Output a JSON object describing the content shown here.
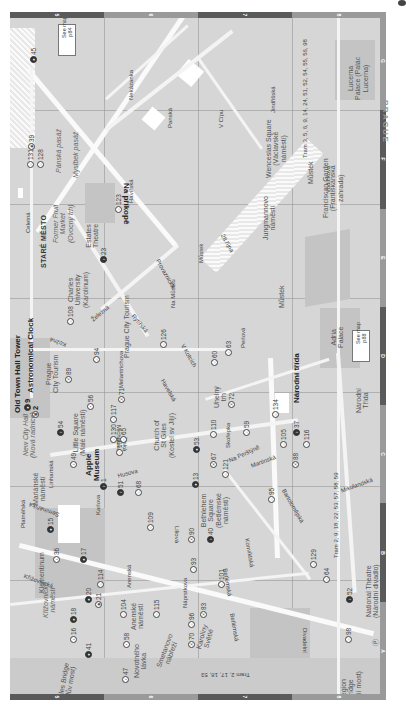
{
  "page": {
    "side_label": "PRAGUE",
    "column_labels": [
      "5",
      "6",
      "7",
      "8"
    ],
    "row_labels": [
      "G",
      "F",
      "E",
      "D",
      "C",
      "B",
      "A"
    ]
  },
  "callouts": [
    {
      "text": "See map\np84"
    },
    {
      "text": "See map\np88"
    }
  ],
  "landmarks": {
    "old_town_hall": "Old Town Hall Tower",
    "astronomical_clock": "Astronomical Clock",
    "stare_mesto": "STARÉ MĚSTO",
    "apple_museum": "Apple\nMuseum",
    "prague_city_tourism_1": "Prague\nCity Tourism",
    "prague_city_tourism_2": "Prague City Tourism",
    "charles_university": "Charles\nUniversity\n(Karolinum)",
    "estates_theatre": "Estates\nTheatre",
    "former_fruit_market": "Former Fruit\nMarket\n(Ovocný trh)",
    "wenceslas_square": "Wenceslas Square\n(Václavské\nnáměstí)",
    "franciscan_garden": "Franciscan Garden\n(Františkánská\nzahrada)",
    "lucerna_palace": "Lucerna\nPalace (Palác\nLucerna)",
    "adria_palace": "Adria\nPalace",
    "little_square": "Little Square\n(Malé náměstí)",
    "new_city_hall": "New City Hall\n(Nová radnice)",
    "church_st_giles": "Church of\nSt Giles\n(Kostel sv Jiljí)",
    "bethlehem_square": "Bethlehem\nSquare\n(Betlémské\nnáměstí)",
    "mariánské": "Mariánské\nnáměstí",
    "klementinum": "Klementinum",
    "krizovnicke": "Křižovnické\nnáměstí",
    "charles_bridge": "Charles Bridge\n(Karlův most)",
    "legion_bridge": "Legion\nBridge\n(Legií most)",
    "national_theatre": "National Theatre\n(Národní divadlo)",
    "jungmannovo": "Jungmannovo\nnáměstí",
    "uhelny_trh": "Uhelný\ntrh",
    "arenske": "Anenské\nnáměstí",
    "novotneho": "Novotného\nlávka",
    "karoliny": "Karoliny\nSvětlé",
    "narodni_trida_metro": "Národní\nTřída"
  },
  "streets": {
    "na_prikope": "Na příkopě",
    "celetna": "Celetná",
    "panska_pasaz": "Pánská pasáž",
    "myslbek_pasaz": "Myslbek pasáž",
    "havirska": "Havířská",
    "provaznicka": "Provaznická",
    "na_mustku": "Na Můstku",
    "28_rijna": "28.října",
    "zelezna": "Železná",
    "rytirska": "Rytířská",
    "kozna": "Kožná",
    "melantrichova": "Melantrichova",
    "havelska": "Havelská",
    "v_kotcich": "V Kotcích",
    "perlova": "Perlová",
    "michalska": "Michalská",
    "jilska": "Jilská",
    "husova": "Husova",
    "skorepka": "Skořepka",
    "na_perstyne": "Na Perštýně",
    "martinska": "Martinská",
    "narodni_trida": "Národní třída",
    "mikulandska": "Mikulandská",
    "bartolomejska": "Bartolomějská",
    "konviktska": "Konviktská",
    "liliova": "Liliová",
    "karlova": "Karlova",
    "seminarska": "Seminářská",
    "linhartska": "Linhartská",
    "platnerska": "Platnéřská",
    "krizovnicka": "Křižovnická",
    "anenska": "Anenská",
    "naprstkova": "Náprstkova",
    "betlemska": "Betlémská",
    "divadelni": "Divadelní",
    "smetanovo": "Smetanovo\nnábřeží",
    "nekazanka": "Nekázanka",
    "panska": "Panská",
    "v_cipu": "V Cípu",
    "jindrisska": "Jindřišská",
    "vodickova": "Vodičkova",
    "tram_top": "Tram 3, 5, 6, 9, 14, 24, 51, 52, 54, 55, 56, 98",
    "tram_mid": "Tram 2, 9, 18, 22, 53, 57, 58, 59",
    "tram_bottom": "Tram 2, 17, 18, 53"
  },
  "metro": {
    "mustek_1": "Můstek",
    "mustek_2": "Můstek",
    "mustek_3": "Můstek"
  },
  "pois": [
    {
      "n": "45",
      "t": "sight"
    },
    {
      "n": "39",
      "t": "shop"
    },
    {
      "n": "131",
      "t": "shop"
    },
    {
      "n": "128",
      "t": "shop"
    },
    {
      "n": "123",
      "t": "shop"
    },
    {
      "n": "23",
      "t": "ent"
    },
    {
      "n": "108",
      "t": "shop"
    },
    {
      "n": "9",
      "t": "sight"
    },
    {
      "n": "2",
      "t": "sight"
    },
    {
      "n": "89",
      "t": "eat"
    },
    {
      "n": "56",
      "t": "sleep"
    },
    {
      "n": "94",
      "t": "shop"
    },
    {
      "n": "71",
      "t": "eat"
    },
    {
      "n": "126",
      "t": "shop"
    },
    {
      "n": "60",
      "t": "drink"
    },
    {
      "n": "63",
      "t": "drink"
    },
    {
      "n": "72",
      "t": "eat"
    },
    {
      "n": "117",
      "t": "shop"
    },
    {
      "n": "130",
      "t": "shop"
    },
    {
      "n": "54",
      "t": "ent"
    },
    {
      "n": "107",
      "t": "drink"
    },
    {
      "n": "65",
      "t": "drink"
    },
    {
      "n": "110",
      "t": "shop"
    },
    {
      "n": "53",
      "t": "sight"
    },
    {
      "n": "67",
      "t": "eat"
    },
    {
      "n": "59",
      "t": "drink"
    },
    {
      "n": "134",
      "t": "shop"
    },
    {
      "n": "37",
      "t": "ent"
    },
    {
      "n": "105",
      "t": "drink"
    },
    {
      "n": "88",
      "t": "eat"
    },
    {
      "n": "116",
      "t": "shop"
    },
    {
      "n": "49",
      "t": "ent"
    },
    {
      "n": "1",
      "t": "ent"
    },
    {
      "n": "51",
      "t": "ent"
    },
    {
      "n": "68",
      "t": "drink"
    },
    {
      "n": "13",
      "t": "sight"
    },
    {
      "n": "121",
      "t": "shop"
    },
    {
      "n": "95",
      "t": "drink"
    },
    {
      "n": "109",
      "t": "shop"
    },
    {
      "n": "90",
      "t": "eat"
    },
    {
      "n": "40",
      "t": "ent"
    },
    {
      "n": "15",
      "t": "sight"
    },
    {
      "n": "36",
      "t": "ent"
    },
    {
      "n": "17",
      "t": "sight"
    },
    {
      "n": "114",
      "t": "shop"
    },
    {
      "n": "93",
      "t": "drink"
    },
    {
      "n": "101",
      "t": "shop"
    },
    {
      "n": "129",
      "t": "shop"
    },
    {
      "n": "64",
      "t": "drink"
    },
    {
      "n": "52",
      "t": "ent"
    },
    {
      "n": "20",
      "t": "sight"
    },
    {
      "n": "21",
      "t": "sight"
    },
    {
      "n": "104",
      "t": "drink"
    },
    {
      "n": "115",
      "t": "shop"
    },
    {
      "n": "96",
      "t": "drink"
    },
    {
      "n": "83",
      "t": "eat"
    },
    {
      "n": "18",
      "t": "sight"
    },
    {
      "n": "16",
      "t": "ent"
    },
    {
      "n": "41",
      "t": "sight"
    },
    {
      "n": "58",
      "t": "sleep"
    },
    {
      "n": "70",
      "t": "eat"
    },
    {
      "n": "47",
      "t": "ent"
    },
    {
      "n": "98",
      "t": "drink"
    }
  ]
}
